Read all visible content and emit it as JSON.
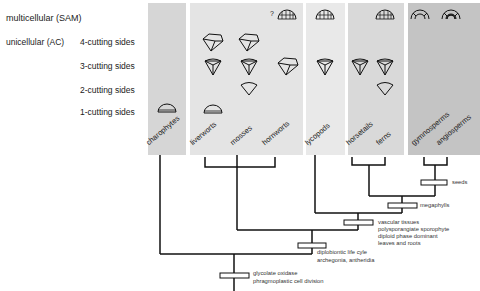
{
  "row_labels": {
    "multicellular": "multicellular (SAM)",
    "unicellular": "unicellular (AC)",
    "four": "4-cutting sides",
    "three": "3-cutting sides",
    "two": "2-cutting sides",
    "one": "1-cutting sides"
  },
  "taxa": {
    "charophytes": "charophytes",
    "liverworts": "liverworts",
    "mosses": "mosses",
    "hornworts": "hornworts",
    "lycopods": "lycopods",
    "horsetails": "horsetails",
    "ferns": "ferns",
    "gymnosperms": "gymnosperms",
    "angiosperms": "angiosperms"
  },
  "question_mark": "?",
  "characters": {
    "seeds": "seeds",
    "megaphylls": "megaphylls",
    "vascular": [
      "vascular tissues",
      "polysporangiate sporophyte",
      "diploid phase dominant",
      "leaves and roots"
    ],
    "diplobiontic": [
      "diplobiontic life cyle",
      "archegonia, antheridia"
    ],
    "glycolate": [
      "glycolate oxidase",
      "phragmoplastic cell division"
    ]
  },
  "colors": {
    "panel_charophytes": "#d6d6d6",
    "panel_bryophytes": "#e4e4e4",
    "panel_lycopods": "#e9e9e9",
    "panel_ferns": "#d9d9d9",
    "panel_seed": "#c4c4c4",
    "line": "#111111"
  }
}
